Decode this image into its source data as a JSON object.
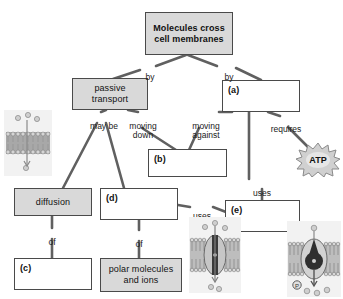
{
  "diagram": {
    "colors": {
      "box_fill_gray": "#d9d9d9",
      "box_fill_white": "#ffffff",
      "box_border": "#4a4a4a",
      "connector": "#606060",
      "text": "#111111",
      "membrane_bg": "#f2f2f2"
    },
    "nodes": [
      {
        "id": "root",
        "label": "Molecules cross\ncell membranes",
        "style": "gray-bold-center",
        "x": 145,
        "y": 12,
        "w": 88,
        "h": 43
      },
      {
        "id": "passive",
        "label": "passive\ntransport",
        "style": "gray-center",
        "x": 72,
        "y": 78,
        "w": 76,
        "h": 32
      },
      {
        "id": "a",
        "label": "(a)",
        "style": "white-topleft",
        "x": 222,
        "y": 80,
        "w": 78,
        "h": 32
      },
      {
        "id": "b",
        "label": "(b)",
        "style": "white-topleft",
        "x": 148,
        "y": 149,
        "w": 79,
        "h": 28
      },
      {
        "id": "diffusion",
        "label": "diffusion",
        "style": "gray-center",
        "x": 14,
        "y": 188,
        "w": 78,
        "h": 28
      },
      {
        "id": "d",
        "label": "(d)",
        "style": "white-topleft",
        "x": 100,
        "y": 188,
        "w": 78,
        "h": 32
      },
      {
        "id": "e",
        "label": "(e)",
        "style": "white-topleft",
        "x": 225,
        "y": 200,
        "w": 75,
        "h": 32
      },
      {
        "id": "c",
        "label": "(c)",
        "style": "white-topleft",
        "x": 14,
        "y": 258,
        "w": 78,
        "h": 32
      },
      {
        "id": "polar",
        "label": "polar molecules\nand ions",
        "style": "gray-center",
        "x": 100,
        "y": 258,
        "w": 82,
        "h": 34
      }
    ],
    "edge_labels": [
      {
        "id": "by-left",
        "text": "by",
        "x": 141,
        "y": 63,
        "w": 18
      },
      {
        "id": "by-right",
        "text": "by",
        "x": 220,
        "y": 63,
        "w": 18
      },
      {
        "id": "may-be",
        "text": "may be",
        "x": 86,
        "y": 112,
        "w": 36
      },
      {
        "id": "moving-down",
        "text": "moving\ndown",
        "x": 125,
        "y": 112,
        "w": 36
      },
      {
        "id": "moving-against",
        "text": "moving\nagainst",
        "x": 186,
        "y": 112,
        "w": 40
      },
      {
        "id": "requires",
        "text": "requires",
        "x": 268,
        "y": 115,
        "w": 36
      },
      {
        "id": "uses-vertical",
        "text": "uses",
        "x": 250,
        "y": 179,
        "w": 24
      },
      {
        "id": "uses-diagonal",
        "text": "uses",
        "x": 190,
        "y": 202,
        "w": 24
      },
      {
        "id": "of-left",
        "text": "of",
        "x": 45,
        "y": 228,
        "w": 14
      },
      {
        "id": "of-right",
        "text": "of",
        "x": 132,
        "y": 230,
        "w": 14
      }
    ],
    "atp": {
      "label": "ATP",
      "x": 296,
      "y": 143,
      "w": 44,
      "h": 34
    },
    "illustrations": [
      {
        "id": "membrane-simple-diffusion",
        "x": 4,
        "y": 110,
        "w": 48,
        "h": 66
      },
      {
        "id": "membrane-channel-protein",
        "x": 189,
        "y": 217,
        "w": 52,
        "h": 76
      },
      {
        "id": "membrane-pump-protein",
        "x": 287,
        "y": 221,
        "w": 54,
        "h": 76
      }
    ]
  }
}
